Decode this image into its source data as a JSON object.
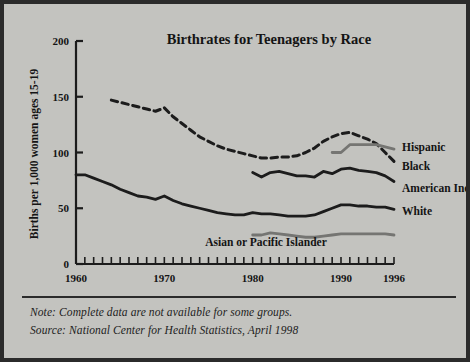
{
  "figure": {
    "background_color": "#c3c3bf",
    "border_color": "#2b2b2b"
  },
  "notes": {
    "note": "Note: Complete data are not available for some groups.",
    "source": "Source: National Center for Health Statistics, April 1998"
  },
  "chart_data": {
    "type": "line",
    "title": "Birthrates for Teenagers by Race",
    "xlabel": "",
    "ylabel": "Births per 1,000 women ages 15-19",
    "xlim": [
      1960,
      1996
    ],
    "ylim": [
      0,
      200
    ],
    "yticks": [
      0,
      50,
      100,
      150,
      200
    ],
    "ytick_labels": [
      "0",
      "50",
      "100",
      "150",
      "200"
    ],
    "xticks": [
      1960,
      1970,
      1980,
      1990,
      1996
    ],
    "xtick_labels": [
      "1960",
      "1970",
      "1980",
      "1990",
      "1996"
    ],
    "xtick_minor_interval": 1,
    "grid": false,
    "legend_position": "right-inline",
    "series": [
      {
        "name": "Black",
        "label": "Black",
        "style": "dashed",
        "color": "#1c1c1c",
        "x": [
          1964,
          1965,
          1966,
          1967,
          1968,
          1969,
          1970,
          1971,
          1972,
          1973,
          1974,
          1975,
          1976,
          1977,
          1978,
          1979,
          1980,
          1981,
          1982,
          1983,
          1984,
          1985,
          1986,
          1987,
          1988,
          1989,
          1990,
          1991,
          1992,
          1993,
          1994,
          1995,
          1996
        ],
        "values": [
          147,
          145,
          143,
          141,
          139,
          137,
          140,
          132,
          126,
          120,
          114,
          110,
          106,
          103,
          101,
          99,
          97,
          95,
          95,
          96,
          96,
          97,
          100,
          104,
          110,
          114,
          117,
          118,
          115,
          112,
          108,
          100,
          92
        ]
      },
      {
        "name": "Hispanic",
        "label": "Hispanic",
        "style": "solid",
        "color": "#757572",
        "x": [
          1989,
          1990,
          1991,
          1992,
          1993,
          1994,
          1995,
          1996
        ],
        "values": [
          100,
          100,
          107,
          107,
          107,
          107,
          105,
          103
        ]
      },
      {
        "name": "American Indian",
        "label": "American Indian",
        "style": "solid",
        "color": "#1c1c1c",
        "x": [
          1980,
          1981,
          1982,
          1983,
          1984,
          1985,
          1986,
          1987,
          1988,
          1989,
          1990,
          1991,
          1992,
          1993,
          1994,
          1995,
          1996
        ],
        "values": [
          82,
          78,
          82,
          83,
          81,
          79,
          79,
          78,
          83,
          81,
          85,
          86,
          84,
          83,
          82,
          79,
          74
        ]
      },
      {
        "name": "White",
        "label": "White",
        "style": "solid",
        "color": "#1c1c1c",
        "x": [
          1960,
          1961,
          1962,
          1963,
          1964,
          1965,
          1966,
          1967,
          1968,
          1969,
          1970,
          1971,
          1972,
          1973,
          1974,
          1975,
          1976,
          1977,
          1978,
          1979,
          1980,
          1981,
          1982,
          1983,
          1984,
          1985,
          1986,
          1987,
          1988,
          1989,
          1990,
          1991,
          1992,
          1993,
          1994,
          1995,
          1996
        ],
        "values": [
          80,
          80,
          77,
          74,
          71,
          67,
          64,
          61,
          60,
          58,
          61,
          57,
          54,
          52,
          50,
          48,
          46,
          45,
          44,
          44,
          46,
          45,
          45,
          44,
          43,
          43,
          43,
          44,
          47,
          50,
          53,
          53,
          52,
          52,
          51,
          51,
          49
        ]
      },
      {
        "name": "Asian or Pacific Islander",
        "label": "Asian or Pacific Islander",
        "style": "solid",
        "color": "#757572",
        "x": [
          1980,
          1981,
          1982,
          1983,
          1984,
          1985,
          1986,
          1987,
          1988,
          1989,
          1990,
          1991,
          1992,
          1993,
          1994,
          1995,
          1996
        ],
        "values": [
          26,
          26,
          28,
          27,
          26,
          25,
          24,
          24,
          25,
          26,
          27,
          27,
          27,
          27,
          27,
          27,
          26
        ]
      }
    ],
    "annotations": [
      {
        "text": "Hispanic",
        "x_px": 398,
        "y_px": 147
      },
      {
        "text": "Black",
        "x_px": 398,
        "y_px": 166
      },
      {
        "text": "American Indian",
        "x_px": 398,
        "y_px": 188
      },
      {
        "text": "White",
        "x_px": 398,
        "y_px": 211
      },
      {
        "text": "Asian or Pacific Islander",
        "x_px": 262,
        "y_px": 242
      }
    ]
  }
}
